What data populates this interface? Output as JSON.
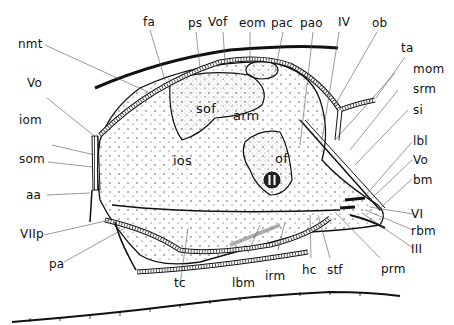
{
  "figure": {
    "type": "anatomical-diagram"
  },
  "labels": {
    "fa": "fa",
    "ps": "ps",
    "Vof": "Vof",
    "eom": "eom",
    "pac": "pac",
    "pao": "pao",
    "IV": "IV",
    "ob": "ob",
    "ta": "ta",
    "mom": "mom",
    "srm": "srm",
    "si": "si",
    "lbl": "lbl",
    "Vo_right": "Vo",
    "bm": "bm",
    "VI": "VI",
    "rbm": "rbm",
    "III": "III",
    "prm": "prm",
    "stf": "stf",
    "hc": "hc",
    "irm": "irm",
    "lbm": "lbm",
    "tc": "tc",
    "pa": "pa",
    "VIIp": "VIIp",
    "aa": "aa",
    "som": "som",
    "iom": "iom",
    "Vo_left": "Vo",
    "nmt": "nmt",
    "sof": "sof",
    "arm": "arm",
    "ios": "ios",
    "of": "of",
    "II": "II"
  },
  "colors": {
    "ink": "#111111",
    "leader": "#555555",
    "stipple": "#333333",
    "background": "#ffffff"
  }
}
